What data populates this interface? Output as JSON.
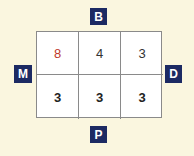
{
  "labels": {
    "top": "B",
    "left": "M",
    "right": "D",
    "bottom": "P"
  },
  "grid": {
    "rows": [
      [
        {
          "value": "8",
          "color": "#c0392b"
        },
        {
          "value": "4",
          "color": "#333333"
        },
        {
          "value": "3",
          "color": "#333333"
        }
      ],
      [
        {
          "value": "3",
          "color": "#222222"
        },
        {
          "value": "3",
          "color": "#222222"
        },
        {
          "value": "3",
          "color": "#222222"
        }
      ]
    ]
  },
  "colors": {
    "background": "#faf6df",
    "label_bg": "#1c2a63",
    "highlight": "#c0392b"
  }
}
